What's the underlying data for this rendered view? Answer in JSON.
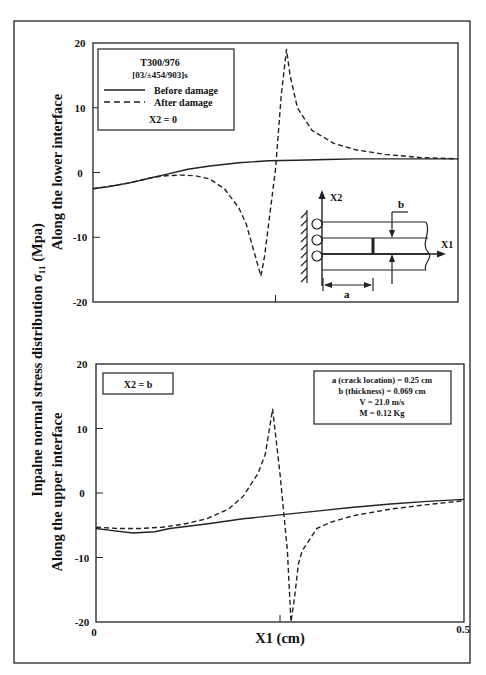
{
  "figure": {
    "y_axis_title_main": "Inpalne normal stress distribution  σ₁₁  (Mpa)",
    "x_axis_title": "X1 (cm)",
    "x_tick_labels": [
      "0",
      "0.5"
    ]
  },
  "chart_data": [
    {
      "type": "line",
      "panel": "top",
      "ylabel": "Along the lower interface",
      "xlabel": "X1 (cm)",
      "xlim": [
        0,
        0.5
      ],
      "ylim": [
        -20,
        20
      ],
      "y_ticks": [
        20,
        10,
        0,
        -10,
        -20
      ],
      "y_tick_labels": [
        "20",
        "10",
        "0",
        "-10",
        "-20"
      ],
      "x_center_tick": 0.25,
      "grid": false,
      "legend": {
        "position": "upper-left",
        "title_lines": [
          "T300/976",
          "[03/±454/903]s"
        ],
        "entries": [
          {
            "label": "Before damage",
            "style": "solid"
          },
          {
            "label": "After damage",
            "style": "dashed"
          }
        ],
        "note": "X2 = 0"
      },
      "series": [
        {
          "name": "Before damage",
          "style": "solid",
          "x": [
            0.0,
            0.02,
            0.05,
            0.08,
            0.1,
            0.13,
            0.16,
            0.2,
            0.24,
            0.28,
            0.32,
            0.36,
            0.4,
            0.45,
            0.5
          ],
          "y": [
            -2.5,
            -2.2,
            -1.6,
            -0.8,
            -0.3,
            0.5,
            1.0,
            1.5,
            1.8,
            1.9,
            2.0,
            2.1,
            2.1,
            2.1,
            2.1
          ]
        },
        {
          "name": "After damage",
          "style": "dashed",
          "x": [
            0.0,
            0.02,
            0.05,
            0.08,
            0.1,
            0.12,
            0.14,
            0.16,
            0.18,
            0.2,
            0.21,
            0.22,
            0.23,
            0.235,
            0.25,
            0.258,
            0.265,
            0.27,
            0.28,
            0.3,
            0.33,
            0.36,
            0.4,
            0.45,
            0.5
          ],
          "y": [
            -2.5,
            -2.2,
            -1.6,
            -0.8,
            -0.5,
            -0.4,
            -0.5,
            -1.0,
            -2.5,
            -5.5,
            -8.0,
            -12.0,
            -16.0,
            -13.0,
            0.5,
            12.0,
            19.0,
            15.0,
            10.0,
            6.5,
            4.5,
            3.5,
            2.8,
            2.3,
            2.1
          ]
        }
      ],
      "inset_diagram": {
        "labels": {
          "x2_axis": "X2",
          "x1_axis": "X1",
          "thickness": "b",
          "crack_location": "a"
        }
      }
    },
    {
      "type": "line",
      "panel": "bottom",
      "ylabel": "Along the upper interface",
      "xlabel": "X1 (cm)",
      "xlim": [
        0,
        0.5
      ],
      "ylim": [
        -20,
        20
      ],
      "y_ticks": [
        20,
        10,
        0,
        -10,
        -20
      ],
      "y_tick_labels": [
        "20",
        "10",
        "0",
        "-10",
        "-20"
      ],
      "x_center_tick": 0.25,
      "grid": false,
      "annotations": {
        "left_box": "X2 = b",
        "right_box": [
          "a (crack location) = 0.25 cm",
          "b (thickness) = 0.069 cm",
          "V = 21.0 m/s",
          "M = 0.12 Kg"
        ]
      },
      "series": [
        {
          "name": "Before damage",
          "style": "solid",
          "x": [
            0.0,
            0.02,
            0.05,
            0.08,
            0.1,
            0.15,
            0.2,
            0.25,
            0.3,
            0.35,
            0.4,
            0.45,
            0.5
          ],
          "y": [
            -5.5,
            -5.8,
            -6.2,
            -6.0,
            -5.5,
            -4.8,
            -4.0,
            -3.4,
            -2.8,
            -2.2,
            -1.7,
            -1.3,
            -1.0
          ]
        },
        {
          "name": "After damage",
          "style": "dashed",
          "x": [
            0.0,
            0.03,
            0.06,
            0.09,
            0.12,
            0.15,
            0.18,
            0.2,
            0.22,
            0.23,
            0.24,
            0.25,
            0.26,
            0.265,
            0.27,
            0.275,
            0.28,
            0.3,
            0.32,
            0.35,
            0.4,
            0.45,
            0.5
          ],
          "y": [
            -5.3,
            -5.5,
            -5.5,
            -5.3,
            -4.8,
            -4.0,
            -2.5,
            -0.5,
            3.0,
            6.0,
            13.0,
            3.0,
            -9.0,
            -20.0,
            -16.0,
            -11.0,
            -9.0,
            -5.5,
            -4.5,
            -3.5,
            -2.5,
            -1.8,
            -1.2
          ]
        }
      ]
    }
  ]
}
